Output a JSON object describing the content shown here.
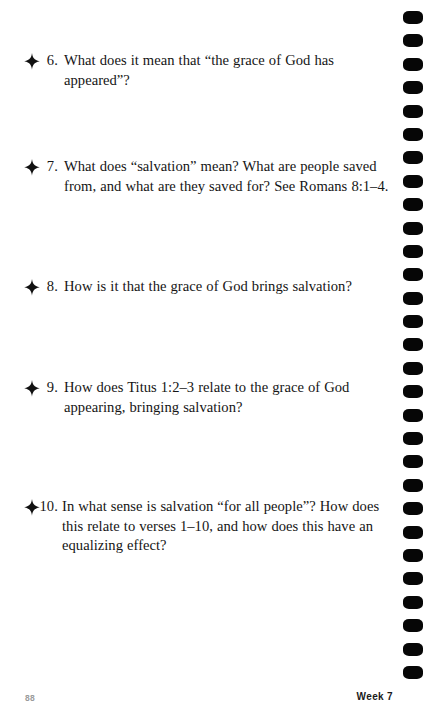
{
  "page": {
    "background_color": "#ffffff",
    "text_color": "#151515",
    "binding_color": "#060606",
    "binding_hole_count": 29
  },
  "questions": [
    {
      "bullet_icon": "four-pointed-star-icon",
      "number": "6.",
      "text": "What does it mean that “the grace of God has appeared”?"
    },
    {
      "bullet_icon": "four-pointed-star-icon",
      "number": "7.",
      "text": "What does “salvation” mean? What are people saved from, and what are they saved for? See Romans 8:1–4."
    },
    {
      "bullet_icon": "four-pointed-star-icon",
      "number": "8.",
      "text": "How is it that the grace of God brings salvation?"
    },
    {
      "bullet_icon": "four-pointed-star-icon",
      "number": "9.",
      "text": "How does Titus 1:2–3 relate to the grace of God appearing, bringing salvation?"
    },
    {
      "bullet_icon": "four-pointed-star-icon",
      "number": "10.",
      "text": "In what sense is salvation “for all people”? How does this relate to verses 1–10, and how does this have an equalizing effect?"
    }
  ],
  "footer": {
    "page_number": "88",
    "section_label": "Week 7"
  }
}
